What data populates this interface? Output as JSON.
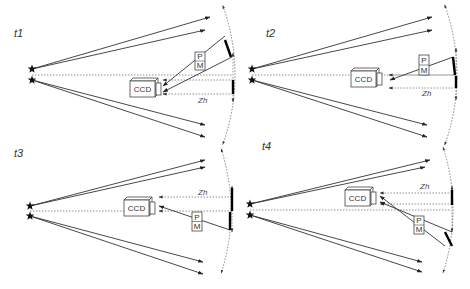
{
  "figure": {
    "panels": [
      {
        "id": "t1",
        "label": "t1",
        "label_pos": [
          14,
          37
        ],
        "stars": [
          [
            32,
            69
          ],
          [
            32,
            80
          ]
        ],
        "rays_out": [
          [
            [
              32,
              69
            ],
            [
              210,
              17
            ]
          ],
          [
            [
              32,
              69
            ],
            [
              205,
              30
            ]
          ],
          [
            [
              32,
              80
            ],
            [
              205,
              125
            ]
          ],
          [
            [
              32,
              80
            ],
            [
              205,
              137
            ]
          ]
        ],
        "dotted_center": [
          [
            32,
            75
          ],
          [
            233,
            75
          ]
        ],
        "ccd": {
          "x": 130,
          "y": 81,
          "w": 25,
          "h": 16,
          "label": "CCD"
        },
        "pm": {
          "x": 195,
          "y": 52,
          "w": 10,
          "h": 18,
          "labels": [
            "P",
            "M"
          ]
        },
        "zh": {
          "label": "Zh",
          "x": 198,
          "y": 103
        },
        "scan_line": {
          "x": 233,
          "y1": 53,
          "y2": 102
        },
        "mirror_segments": [
          [
            [
              225,
              40
            ],
            [
              231,
              57
            ]
          ],
          [
            [
              233,
              80
            ],
            [
              233,
              94
            ]
          ]
        ],
        "beams_to_ccd": [
          [
            [
              225,
              36
            ],
            [
              163,
              86
            ]
          ],
          [
            [
              232,
              57
            ],
            [
              163,
              92
            ]
          ]
        ],
        "dotted_to_ccd": [
          [
            [
              233,
              80
            ],
            [
              163,
              80
            ]
          ],
          [
            [
              233,
              94
            ],
            [
              163,
              94
            ]
          ]
        ],
        "arc": {
          "cx": 32,
          "cy": 75,
          "r": 203,
          "a1": -20,
          "a2": 20
        }
      },
      {
        "id": "t2",
        "label": "t2",
        "label_pos": [
          266,
          37
        ],
        "stars": [
          [
            252,
            69
          ],
          [
            252,
            80
          ]
        ],
        "rays_out": [
          [
            [
              252,
              69
            ],
            [
              432,
              17
            ]
          ],
          [
            [
              252,
              69
            ],
            [
              432,
              30
            ]
          ],
          [
            [
              252,
              80
            ],
            [
              427,
              125
            ]
          ],
          [
            [
              252,
              80
            ],
            [
              427,
              137
            ]
          ]
        ],
        "dotted_center": [
          [
            252,
            75
          ],
          [
            455,
            75
          ]
        ],
        "ccd": {
          "x": 351,
          "y": 71,
          "w": 25,
          "h": 16,
          "label": "CCD"
        },
        "pm": {
          "x": 419,
          "y": 55,
          "w": 10,
          "h": 20,
          "labels": [
            "P",
            "M"
          ]
        },
        "zh": {
          "label": "Zh",
          "x": 422,
          "y": 96
        },
        "scan_line": {
          "x": 456,
          "y1": 48,
          "y2": 100
        },
        "mirror_segments": [
          [
            [
              453,
              57
            ],
            [
              455,
              75
            ]
          ],
          [
            [
              456,
              76
            ],
            [
              456,
              88
            ]
          ]
        ],
        "beams_to_ccd": [
          [
            [
              453,
              57
            ],
            [
              390,
              80
            ]
          ]
        ],
        "dotted_to_ccd": [
          [
            [
              456,
              75
            ],
            [
              389,
              75
            ]
          ],
          [
            [
              456,
              88
            ],
            [
              389,
              88
            ]
          ]
        ],
        "arc": {
          "cx": 252,
          "cy": 75,
          "r": 205,
          "a1": -20,
          "a2": 20
        }
      },
      {
        "id": "t3",
        "label": "t3",
        "label_pos": [
          14,
          157
        ],
        "stars": [
          [
            30,
            206
          ],
          [
            30,
            216
          ]
        ],
        "rays_out": [
          [
            [
              30,
              206
            ],
            [
              205,
              160
            ]
          ],
          [
            [
              30,
              206
            ],
            [
              205,
              167
            ]
          ],
          [
            [
              30,
              216
            ],
            [
              203,
              262
            ]
          ],
          [
            [
              30,
              216
            ],
            [
              203,
              274
            ]
          ]
        ],
        "dotted_center": [
          [
            30,
            211
          ],
          [
            124,
            211
          ]
        ],
        "ccd": {
          "x": 124,
          "y": 200,
          "w": 25,
          "h": 16,
          "label": "CCD"
        },
        "pm": {
          "x": 192,
          "y": 212,
          "w": 10,
          "h": 19,
          "labels": [
            "P",
            "M"
          ]
        },
        "zh": {
          "label": "Zh",
          "x": 198,
          "y": 195
        },
        "scan_line": {
          "x": 232,
          "y1": 186,
          "y2": 232
        },
        "mirror_segments": [
          [
            [
              232,
              188
            ],
            [
              232,
              211
            ]
          ],
          [
            [
              230,
              212
            ],
            [
              230,
              230
            ]
          ]
        ],
        "beams_to_ccd": [
          [
            [
              230,
              230
            ],
            [
              159,
              206
            ]
          ]
        ],
        "dotted_to_ccd": [
          [
            [
              232,
              197
            ],
            [
              159,
              197
            ]
          ],
          [
            [
              232,
              211
            ],
            [
              159,
              211
            ]
          ]
        ],
        "arc": {
          "cx": 30,
          "cy": 211,
          "r": 201,
          "a1": -18,
          "a2": 18
        }
      },
      {
        "id": "t4",
        "label": "t4",
        "label_pos": [
          262,
          150
        ],
        "stars": [
          [
            250,
            204
          ],
          [
            250,
            215
          ]
        ],
        "rays_out": [
          [
            [
              250,
              204
            ],
            [
              430,
              160
            ]
          ],
          [
            [
              250,
              204
            ],
            [
              425,
              167
            ]
          ],
          [
            [
              250,
              215
            ],
            [
              422,
              262
            ]
          ],
          [
            [
              250,
              215
            ],
            [
              422,
              272
            ]
          ]
        ],
        "dotted_center": [
          [
            250,
            210
          ],
          [
            450,
            210
          ]
        ],
        "ccd": {
          "x": 345,
          "y": 190,
          "w": 25,
          "h": 16,
          "label": "CCD"
        },
        "pm": {
          "x": 414,
          "y": 216,
          "w": 10,
          "h": 18,
          "labels": [
            "P",
            "M"
          ]
        },
        "zh": {
          "label": "Zh",
          "x": 420,
          "y": 189
        },
        "scan_line": {
          "x": 452,
          "y1": 186,
          "y2": 232
        },
        "mirror_segments": [
          [
            [
              452,
              190
            ],
            [
              452,
              205
            ]
          ],
          [
            [
              445,
              232
            ],
            [
              452,
              246
            ]
          ]
        ],
        "beams_to_ccd": [
          [
            [
              445,
              246
            ],
            [
              380,
              196
            ]
          ],
          [
            [
              452,
              232
            ],
            [
              380,
              202
            ]
          ]
        ],
        "dotted_to_ccd": [
          [
            [
              452,
              193
            ],
            [
              380,
              193
            ]
          ],
          [
            [
              452,
              204
            ],
            [
              380,
              204
            ]
          ]
        ],
        "arc": {
          "cx": 250,
          "cy": 210,
          "r": 203,
          "a1": -18,
          "a2": 18
        }
      }
    ],
    "colors": {
      "ink": "#333333",
      "mirror": "#000000",
      "dotted": "#777777",
      "background": "#ffffff"
    }
  }
}
